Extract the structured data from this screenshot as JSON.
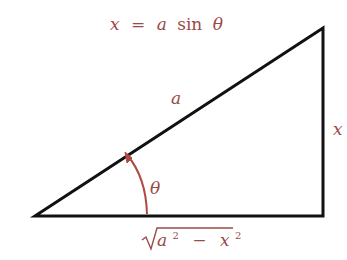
{
  "diagram": {
    "type": "right-triangle-trig-substitution",
    "title": "x = a sin θ",
    "title_parts": {
      "lhs": "x",
      "eq": "=",
      "coef": "a",
      "func": "sin",
      "arg": "θ"
    },
    "labels": {
      "hypotenuse": "a",
      "opposite": "x",
      "angle": "θ",
      "adjacent": {
        "radical": "√",
        "a": "a",
        "a_exp": "2",
        "minus": "−",
        "x": "x",
        "x_exp": "2"
      }
    },
    "colors": {
      "lines": "#111111",
      "labels": "#9a4a4a",
      "arc": "#b04a45",
      "background": "#ffffff"
    },
    "vertices": {
      "left": [
        35,
        216
      ],
      "bottom_right": [
        323,
        216
      ],
      "top_right": [
        323,
        28
      ]
    }
  }
}
